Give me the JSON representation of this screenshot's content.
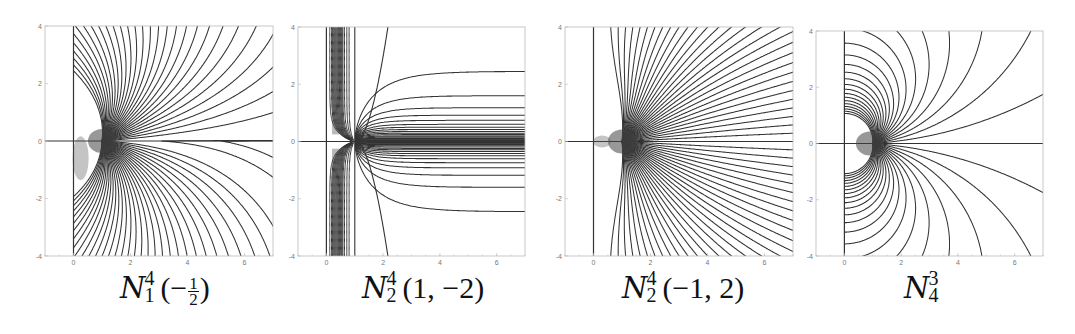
{
  "figure": {
    "panels": [
      {
        "id": "p1",
        "caption": {
          "sup": "4",
          "sub": "1",
          "args_before": "(−",
          "frac_num": "1",
          "frac_den": "2",
          "args_after": ")",
          "args": ""
        },
        "frame": {
          "left": 45,
          "top": 26,
          "right": 273,
          "bottom": 256
        },
        "xlim": [
          -1,
          7
        ],
        "ylim": [
          -4,
          4
        ],
        "xticks": [
          0,
          2,
          4,
          6
        ],
        "yticks": [
          -4,
          -2,
          0,
          2,
          4
        ],
        "caption_left": 120
      },
      {
        "id": "p2",
        "caption": {
          "sup": "4",
          "sub": "2",
          "args": "(1, −2)"
        },
        "frame": {
          "left": 298,
          "top": 27,
          "right": 525,
          "bottom": 256
        },
        "xlim": [
          -1,
          7
        ],
        "ylim": [
          -4,
          4
        ],
        "xticks": [
          0,
          2,
          4,
          6
        ],
        "yticks": [
          -4,
          -2,
          0,
          2,
          4
        ],
        "caption_left": 355
      },
      {
        "id": "p3",
        "caption": {
          "sup": "4",
          "sub": "2",
          "args": "(−1, 2)"
        },
        "frame": {
          "left": 565,
          "top": 27,
          "right": 793,
          "bottom": 256
        },
        "xlim": [
          -1,
          7
        ],
        "ylim": [
          -4,
          4
        ],
        "xticks": [
          0,
          2,
          4,
          6
        ],
        "yticks": [
          -4,
          -2,
          0,
          2,
          4
        ],
        "caption_left": 620
      },
      {
        "id": "p4",
        "caption": {
          "sup": "3",
          "sub": "4",
          "args": ""
        },
        "frame": {
          "left": 816,
          "top": 31,
          "right": 1043,
          "bottom": 256
        },
        "xlim": [
          -1,
          7
        ],
        "ylim": [
          -4,
          4
        ],
        "xticks": [
          0,
          2,
          4,
          6
        ],
        "yticks": [
          -4,
          -2,
          0,
          2,
          4
        ],
        "caption_left": 902
      }
    ],
    "colors": {
      "curve": "#333333",
      "frame": "#bbbbbb",
      "axis": "#222222",
      "tick_label": "#777777",
      "background": "#ffffff"
    }
  },
  "chart_data": [
    {
      "type": "line",
      "title": "N_1^4(-1/2)",
      "description": "Family of field/stream curves emanating from a singular point near (1, 0); dense fan in lower half, arcs bending right in upper half",
      "xlim": [
        -1,
        7
      ],
      "ylim": [
        -4,
        4
      ],
      "xticks": [
        0,
        2,
        4,
        6
      ],
      "yticks": [
        -4,
        -2,
        0,
        2,
        4
      ],
      "grid": false,
      "singular_point": [
        1,
        0
      ],
      "reference_lines": [
        "x=0",
        "y=0"
      ]
    },
    {
      "type": "line",
      "title": "N_2^4(1,-2)",
      "description": "Curves accumulating along vertical strip x≈0.2–0.8 and along positive real axis y=0 for x>1; horizontal asymptotes at y≈±2.5, ±1.6, ±1.2, ...",
      "xlim": [
        -1,
        7
      ],
      "ylim": [
        -4,
        4
      ],
      "xticks": [
        0,
        2,
        4,
        6
      ],
      "yticks": [
        -4,
        -2,
        0,
        2,
        4
      ],
      "grid": false,
      "singular_point": [
        1,
        0
      ],
      "reference_lines": [
        "x=0",
        "x=1",
        "y=0"
      ]
    },
    {
      "type": "line",
      "title": "N_2^4(-1,2)",
      "description": "Symmetric fan of curves emanating from near (1, 0) spreading up and down; small loops to the left toward x=0",
      "xlim": [
        -1,
        7
      ],
      "ylim": [
        -4,
        4
      ],
      "xticks": [
        0,
        2,
        4,
        6
      ],
      "yticks": [
        -4,
        -2,
        0,
        2,
        4
      ],
      "grid": false,
      "singular_point": [
        1,
        0
      ],
      "reference_lines": [
        "x=0",
        "y=0"
      ]
    },
    {
      "type": "line",
      "title": "N_4^3",
      "description": "Dipole-like circular arcs from x=0 axis centered near (1, 0); symmetric about y=0",
      "xlim": [
        -1,
        7
      ],
      "ylim": [
        -4,
        4
      ],
      "xticks": [
        0,
        2,
        4,
        6
      ],
      "yticks": [
        -4,
        -2,
        0,
        2,
        4
      ],
      "grid": false,
      "singular_point": [
        1,
        0
      ],
      "reference_lines": [
        "x=0",
        "y=0"
      ]
    }
  ]
}
